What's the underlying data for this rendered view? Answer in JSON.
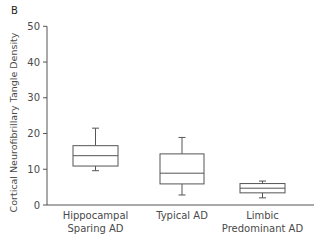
{
  "panel_label": "B",
  "chart_data": {
    "type": "boxplot",
    "title": "",
    "xlabel": "",
    "ylabel": "Cortical Neurofibrillary Tangle Density",
    "ylim": [
      0,
      50
    ],
    "yticks": [
      0,
      10,
      20,
      30,
      40,
      50
    ],
    "grid": false,
    "legend": null,
    "categories": [
      [
        "Hippocampal",
        "Sparing AD"
      ],
      [
        "Typical AD"
      ],
      [
        "Limbic",
        "Predominant AD"
      ]
    ],
    "series": [
      {
        "name": "Hippocampal Sparing AD",
        "min": 9.6,
        "q1": 10.9,
        "median": 13.8,
        "q3": 16.6,
        "max": 21.5
      },
      {
        "name": "Typical AD",
        "min": 2.8,
        "q1": 5.9,
        "median": 8.9,
        "q3": 14.3,
        "max": 18.9
      },
      {
        "name": "Limbic Predominant AD",
        "min": 2.0,
        "q1": 3.4,
        "median": 4.7,
        "q3": 6.0,
        "max": 6.7
      }
    ]
  },
  "style": {
    "axis_color": "#555555",
    "box_color": "#555555"
  }
}
